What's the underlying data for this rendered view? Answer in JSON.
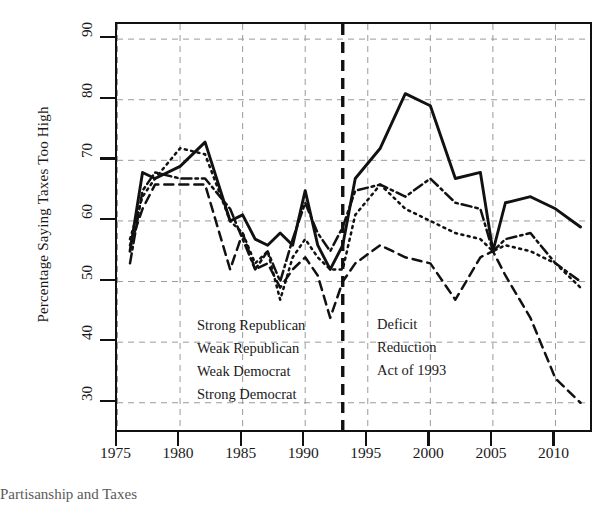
{
  "chart_data": {
    "type": "line",
    "title": "",
    "xlabel": "",
    "ylabel": "Percentage Saying Taxes Too High",
    "xlim": [
      1975,
      2012
    ],
    "ylim": [
      26,
      92
    ],
    "xticks": [
      1975,
      1980,
      1985,
      1990,
      1995,
      2000,
      2005,
      2010
    ],
    "yticks": [
      30,
      40,
      50,
      60,
      70,
      80,
      90
    ],
    "grid": true,
    "legend_position": "inside-lower-left",
    "annotations": [
      {
        "name": "deficit-reduction-act",
        "text_lines": [
          "Deficit",
          "Reduction",
          "Act of 1993"
        ],
        "x": 1993,
        "style": "vertical-dashed-line"
      }
    ],
    "series": [
      {
        "name": "Strong Republican",
        "style": "solid",
        "x": [
          1976,
          1977,
          1978,
          1980,
          1982,
          1984,
          1985,
          1986,
          1987,
          1988,
          1989,
          1990,
          1991,
          1992,
          1993,
          1994,
          1996,
          1998,
          2000,
          2002,
          2004,
          2005,
          2006,
          2008,
          2010,
          2012
        ],
        "values": [
          55,
          68,
          67,
          69,
          73,
          60,
          61,
          57,
          56,
          58,
          56,
          65,
          56,
          52,
          56,
          67,
          72,
          81,
          79,
          67,
          68,
          55,
          63,
          64,
          62,
          59
        ]
      },
      {
        "name": "Weak Republican",
        "style": "dashdot",
        "x": [
          1976,
          1977,
          1978,
          1980,
          1982,
          1984,
          1985,
          1986,
          1987,
          1988,
          1989,
          1990,
          1991,
          1992,
          1993,
          1994,
          1996,
          1998,
          2000,
          2002,
          2004,
          2005,
          2006,
          2008,
          2010,
          2012
        ],
        "values": [
          53,
          65,
          68,
          67,
          67,
          62,
          57,
          52,
          55,
          50,
          57,
          63,
          58,
          55,
          59,
          65,
          66,
          64,
          67,
          63,
          62,
          55,
          57,
          58,
          53,
          50
        ]
      },
      {
        "name": "Weak Democrat",
        "style": "dotted",
        "x": [
          1976,
          1977,
          1978,
          1980,
          1982,
          1984,
          1985,
          1986,
          1987,
          1988,
          1989,
          1990,
          1991,
          1992,
          1993,
          1994,
          1996,
          1998,
          2000,
          2002,
          2004,
          2005,
          2006,
          2008,
          2010,
          2012
        ],
        "values": [
          57,
          64,
          67,
          72,
          71,
          60,
          58,
          53,
          55,
          47,
          54,
          57,
          54,
          52,
          52,
          61,
          66,
          62,
          60,
          58,
          57,
          55,
          56,
          55,
          53,
          49
        ]
      },
      {
        "name": "Strong Democrat",
        "style": "dashed",
        "x": [
          1976,
          1977,
          1978,
          1980,
          1982,
          1984,
          1985,
          1986,
          1987,
          1988,
          1989,
          1990,
          1991,
          1992,
          1993,
          1994,
          1996,
          1998,
          2000,
          2002,
          2004,
          2005,
          2006,
          2008,
          2010,
          2012
        ],
        "values": [
          56,
          62,
          66,
          66,
          66,
          52,
          58,
          52,
          53,
          49,
          52,
          54,
          51,
          44,
          50,
          53,
          56,
          54,
          53,
          47,
          54,
          55,
          51,
          44,
          34,
          30
        ]
      }
    ]
  },
  "legend": {
    "items": [
      {
        "label": "Strong Republican",
        "style": "solid"
      },
      {
        "label": "Weak Republican",
        "style": "dashdot"
      },
      {
        "label": "Weak Democrat",
        "style": "dotted"
      },
      {
        "label": "Strong Democrat",
        "style": "dashed"
      }
    ]
  },
  "annotation": {
    "line1": "Deficit",
    "line2": "Reduction",
    "line3": "Act of 1993"
  },
  "axis": {
    "y_label": "Percentage Saying Taxes Too High",
    "y_ticks": [
      "30",
      "40",
      "50",
      "60",
      "70",
      "80",
      "90"
    ],
    "x_ticks": [
      "1975",
      "1980",
      "1985",
      "1990",
      "1995",
      "2000",
      "2005",
      "2010"
    ]
  },
  "caption": {
    "text": "Partisanship and Taxes"
  },
  "colors": {
    "line": "#111111",
    "grid": "#9a9a9a",
    "axis": "#111111",
    "background": "#ffffff"
  }
}
